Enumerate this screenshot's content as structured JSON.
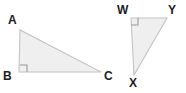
{
  "figure": {
    "background_color": "#ffffff",
    "fill_color": "#efefef",
    "stroke_color": "#c4c4c4",
    "angle_mark_color": "#9a9a9a",
    "label_color": "#1d1d1d",
    "shapes": [
      {
        "name": "triangle-abc",
        "kind": "right-triangle",
        "points": "20,30 19,72 101,72",
        "right_angle_vertex": "B",
        "right_angle_mark": "27,72 27,65 20,65",
        "vertices": [
          {
            "id": "A",
            "label": "A",
            "x": 20,
            "y": 30,
            "label_left": 8,
            "label_top": 14
          },
          {
            "id": "B",
            "label": "B",
            "x": 19,
            "y": 72,
            "label_left": 3,
            "label_top": 70
          },
          {
            "id": "C",
            "label": "C",
            "x": 101,
            "y": 72,
            "label_left": 104,
            "label_top": 70
          }
        ]
      },
      {
        "name": "triangle-wxy",
        "kind": "right-triangle",
        "points": "131,18 167,18 134,75",
        "right_angle_vertex": "W",
        "right_angle_mark": "131,25 138,25 138,18",
        "vertices": [
          {
            "id": "W",
            "label": "W",
            "x": 131,
            "y": 18,
            "label_left": 117,
            "label_top": 4
          },
          {
            "id": "Y",
            "label": "Y",
            "x": 167,
            "y": 18,
            "label_left": 168,
            "label_top": 4
          },
          {
            "id": "X",
            "label": "X",
            "x": 134,
            "y": 75,
            "label_left": 129,
            "label_top": 77
          }
        ]
      }
    ]
  }
}
